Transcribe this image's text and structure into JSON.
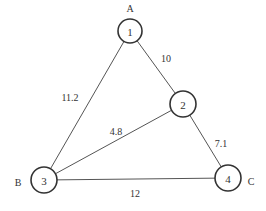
{
  "diagram": {
    "type": "weighted-undirected-graph",
    "colors": {
      "edge": "#555555",
      "node_stroke": "#333333",
      "node_fill": "#ffffff",
      "text": "#333333",
      "background": "#ffffff"
    },
    "nodes": [
      {
        "id": "1",
        "label": "1",
        "letter": "A",
        "cx": 130,
        "cy": 31,
        "r": 12,
        "letter_x": 130,
        "letter_y": 8
      },
      {
        "id": "2",
        "label": "2",
        "letter": "",
        "cx": 183,
        "cy": 104,
        "r": 13,
        "letter_x": 0,
        "letter_y": 0
      },
      {
        "id": "3",
        "label": "3",
        "letter": "B",
        "cx": 44,
        "cy": 180,
        "r": 13,
        "letter_x": 18,
        "letter_y": 182
      },
      {
        "id": "4",
        "label": "4",
        "letter": "C",
        "cx": 228,
        "cy": 178,
        "r": 13,
        "letter_x": 251,
        "letter_y": 181
      }
    ],
    "edges": [
      {
        "from": "1",
        "to": "2",
        "weight": "10",
        "label_x": 166,
        "label_y": 58
      },
      {
        "from": "1",
        "to": "3",
        "weight": "11.2",
        "label_x": 70,
        "label_y": 97
      },
      {
        "from": "2",
        "to": "3",
        "weight": "4.8",
        "label_x": 116,
        "label_y": 131
      },
      {
        "from": "2",
        "to": "4",
        "weight": "7.1",
        "label_x": 221,
        "label_y": 143
      },
      {
        "from": "3",
        "to": "4",
        "weight": "12",
        "label_x": 135,
        "label_y": 193
      }
    ]
  }
}
